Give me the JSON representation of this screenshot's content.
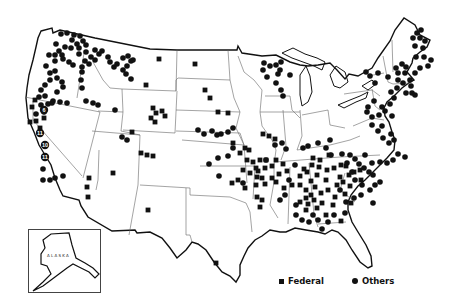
{
  "map": {
    "title": "",
    "region": "Contiguous United States with Alaska inset",
    "inset_label": "ALASKA",
    "colors": {
      "background": "#ffffff",
      "ink": "#111111",
      "state_borders": "#555555"
    }
  },
  "legend": {
    "items": [
      {
        "symbol": "square",
        "label": "Federal"
      },
      {
        "symbol": "circle",
        "label": "Others"
      }
    ]
  },
  "numbered_markers": [
    {
      "label": "6",
      "x": 44,
      "y": 110
    },
    {
      "label": "11",
      "x": 40,
      "y": 133
    },
    {
      "label": "10",
      "x": 45,
      "y": 145
    },
    {
      "label": "11",
      "x": 45,
      "y": 157
    }
  ],
  "markers": {
    "federal": [
      [
        159,
        59
      ],
      [
        195,
        64
      ],
      [
        146,
        85
      ],
      [
        205,
        90
      ],
      [
        210,
        98
      ],
      [
        218,
        112
      ],
      [
        228,
        113
      ],
      [
        153,
        108
      ],
      [
        156,
        113
      ],
      [
        162,
        111
      ],
      [
        151,
        118
      ],
      [
        165,
        116
      ],
      [
        155,
        122
      ],
      [
        132,
        132
      ],
      [
        141,
        153
      ],
      [
        147,
        155
      ],
      [
        153,
        156
      ],
      [
        89,
        178
      ],
      [
        87,
        187
      ],
      [
        88,
        197
      ],
      [
        113,
        173
      ],
      [
        148,
        210
      ],
      [
        216,
        263
      ],
      [
        233,
        143
      ],
      [
        263,
        134
      ],
      [
        269,
        136
      ],
      [
        275,
        139
      ],
      [
        245,
        148
      ],
      [
        249,
        150
      ],
      [
        240,
        153
      ],
      [
        247,
        160
      ],
      [
        253,
        162
      ],
      [
        243,
        170
      ],
      [
        250,
        173
      ],
      [
        258,
        171
      ],
      [
        262,
        178
      ],
      [
        265,
        184
      ],
      [
        256,
        185
      ],
      [
        245,
        188
      ],
      [
        238,
        180
      ],
      [
        232,
        183
      ],
      [
        257,
        197
      ],
      [
        260,
        207
      ],
      [
        272,
        178
      ],
      [
        279,
        174
      ],
      [
        272,
        166
      ],
      [
        266,
        160
      ],
      [
        276,
        160
      ],
      [
        283,
        164
      ],
      [
        287,
        171
      ],
      [
        262,
        200
      ],
      [
        260,
        160
      ],
      [
        36,
        121
      ],
      [
        30,
        122
      ],
      [
        40,
        128
      ],
      [
        35,
        100
      ],
      [
        44,
        118
      ],
      [
        32,
        107
      ],
      [
        304,
        169
      ],
      [
        312,
        165
      ],
      [
        300,
        176
      ],
      [
        307,
        172
      ],
      [
        319,
        167
      ],
      [
        327,
        170
      ],
      [
        334,
        168
      ],
      [
        346,
        166
      ],
      [
        317,
        175
      ],
      [
        311,
        181
      ],
      [
        326,
        180
      ],
      [
        300,
        185
      ],
      [
        306,
        190
      ],
      [
        315,
        187
      ],
      [
        321,
        193
      ],
      [
        306,
        198
      ],
      [
        314,
        200
      ],
      [
        322,
        203
      ],
      [
        337,
        185
      ],
      [
        343,
        182
      ],
      [
        349,
        175
      ],
      [
        354,
        172
      ],
      [
        360,
        170
      ],
      [
        345,
        194
      ],
      [
        333,
        205
      ],
      [
        317,
        208
      ],
      [
        306,
        210
      ],
      [
        326,
        215
      ],
      [
        341,
        221
      ],
      [
        257,
        177
      ],
      [
        256,
        168
      ],
      [
        265,
        168
      ],
      [
        276,
        182
      ],
      [
        284,
        188
      ],
      [
        292,
        185
      ],
      [
        311,
        195
      ],
      [
        300,
        202
      ],
      [
        335,
        197
      ],
      [
        320,
        160
      ],
      [
        313,
        158
      ],
      [
        329,
        155
      ],
      [
        341,
        165
      ],
      [
        328,
        190
      ],
      [
        351,
        203
      ],
      [
        308,
        204
      ],
      [
        340,
        177
      ],
      [
        361,
        180
      ],
      [
        350,
        186
      ]
    ],
    "others": [
      [
        61,
        34
      ],
      [
        67,
        33
      ],
      [
        74,
        35
      ],
      [
        80,
        36
      ],
      [
        72,
        40
      ],
      [
        77,
        44
      ],
      [
        83,
        41
      ],
      [
        86,
        45
      ],
      [
        79,
        48
      ],
      [
        71,
        48
      ],
      [
        65,
        47
      ],
      [
        56,
        44
      ],
      [
        59,
        51
      ],
      [
        62,
        55
      ],
      [
        55,
        55
      ],
      [
        49,
        55
      ],
      [
        55,
        61
      ],
      [
        63,
        59
      ],
      [
        69,
        62
      ],
      [
        79,
        54
      ],
      [
        86,
        52
      ],
      [
        91,
        57
      ],
      [
        85,
        61
      ],
      [
        95,
        60
      ],
      [
        73,
        65
      ],
      [
        82,
        67
      ],
      [
        89,
        64
      ],
      [
        46,
        66
      ],
      [
        50,
        73
      ],
      [
        55,
        71
      ],
      [
        50,
        80
      ],
      [
        45,
        85
      ],
      [
        57,
        78
      ],
      [
        62,
        82
      ],
      [
        63,
        87
      ],
      [
        57,
        92
      ],
      [
        41,
        90
      ],
      [
        39,
        97
      ],
      [
        45,
        96
      ],
      [
        53,
        101
      ],
      [
        48,
        104
      ],
      [
        41,
        105
      ],
      [
        36,
        114
      ],
      [
        44,
        112
      ],
      [
        52,
        103
      ],
      [
        60,
        102
      ],
      [
        67,
        103
      ],
      [
        99,
        54
      ],
      [
        102,
        51
      ],
      [
        95,
        50
      ],
      [
        108,
        57
      ],
      [
        110,
        62
      ],
      [
        114,
        67
      ],
      [
        117,
        64
      ],
      [
        123,
        58
      ],
      [
        128,
        56
      ],
      [
        131,
        61
      ],
      [
        127,
        66
      ],
      [
        123,
        70
      ],
      [
        126,
        74
      ],
      [
        131,
        79
      ],
      [
        133,
        60
      ],
      [
        82,
        72
      ],
      [
        81,
        80
      ],
      [
        82,
        88
      ],
      [
        86,
        101
      ],
      [
        93,
        103
      ],
      [
        98,
        105
      ],
      [
        115,
        110
      ],
      [
        198,
        130
      ],
      [
        204,
        134
      ],
      [
        212,
        131
      ],
      [
        217,
        135
      ],
      [
        221,
        134
      ],
      [
        228,
        132
      ],
      [
        233,
        128
      ],
      [
        122,
        137
      ],
      [
        127,
        140
      ],
      [
        63,
        176
      ],
      [
        55,
        178
      ],
      [
        50,
        180
      ],
      [
        43,
        180
      ],
      [
        43,
        169
      ],
      [
        209,
        164
      ],
      [
        218,
        158
      ],
      [
        219,
        176
      ],
      [
        243,
        183
      ],
      [
        266,
        160
      ],
      [
        275,
        145
      ],
      [
        282,
        143
      ],
      [
        286,
        149
      ],
      [
        330,
        140
      ],
      [
        326,
        148
      ],
      [
        331,
        155
      ],
      [
        342,
        154
      ],
      [
        350,
        155
      ],
      [
        355,
        159
      ],
      [
        359,
        164
      ],
      [
        364,
        168
      ],
      [
        369,
        172
      ],
      [
        355,
        180
      ],
      [
        362,
        185
      ],
      [
        370,
        190
      ],
      [
        375,
        185
      ],
      [
        380,
        182
      ],
      [
        373,
        175
      ],
      [
        347,
        163
      ],
      [
        352,
        172
      ],
      [
        340,
        190
      ],
      [
        346,
        202
      ],
      [
        354,
        198
      ],
      [
        361,
        195
      ],
      [
        373,
        203
      ],
      [
        345,
        213
      ],
      [
        334,
        215
      ],
      [
        328,
        222
      ],
      [
        322,
        229
      ],
      [
        318,
        220
      ],
      [
        313,
        215
      ],
      [
        309,
        222
      ],
      [
        302,
        220
      ],
      [
        296,
        215
      ],
      [
        296,
        205
      ],
      [
        285,
        195
      ],
      [
        280,
        200
      ],
      [
        289,
        180
      ],
      [
        295,
        165
      ],
      [
        365,
        155
      ],
      [
        372,
        163
      ],
      [
        380,
        162
      ],
      [
        387,
        163
      ],
      [
        393,
        160
      ],
      [
        398,
        154
      ],
      [
        405,
        157
      ],
      [
        389,
        143
      ],
      [
        383,
        138
      ],
      [
        378,
        131
      ],
      [
        372,
        125
      ],
      [
        367,
        112
      ],
      [
        368,
        107
      ],
      [
        374,
        101
      ],
      [
        382,
        107
      ],
      [
        390,
        104
      ],
      [
        394,
        98
      ],
      [
        391,
        92
      ],
      [
        397,
        88
      ],
      [
        406,
        93
      ],
      [
        412,
        93
      ],
      [
        415,
        95
      ],
      [
        410,
        80
      ],
      [
        411,
        86
      ],
      [
        403,
        83
      ],
      [
        398,
        80
      ],
      [
        406,
        67
      ],
      [
        402,
        64
      ],
      [
        396,
        68
      ],
      [
        388,
        77
      ],
      [
        398,
        73
      ],
      [
        405,
        73
      ],
      [
        415,
        73
      ],
      [
        420,
        68
      ],
      [
        428,
        66
      ],
      [
        431,
        60
      ],
      [
        424,
        57
      ],
      [
        416,
        57
      ],
      [
        415,
        46
      ],
      [
        423,
        48
      ],
      [
        425,
        41
      ],
      [
        420,
        38
      ],
      [
        413,
        38
      ],
      [
        417,
        33
      ],
      [
        421,
        30
      ],
      [
        375,
        83
      ],
      [
        370,
        76
      ],
      [
        378,
        73
      ],
      [
        366,
        72
      ],
      [
        379,
        115
      ],
      [
        385,
        111
      ],
      [
        392,
        116
      ],
      [
        372,
        117
      ],
      [
        382,
        126
      ],
      [
        391,
        134
      ],
      [
        394,
        140
      ],
      [
        264,
        63
      ],
      [
        270,
        66
      ],
      [
        276,
        65
      ],
      [
        281,
        62
      ],
      [
        280,
        70
      ],
      [
        278,
        74
      ],
      [
        263,
        70
      ],
      [
        276,
        83
      ],
      [
        281,
        90
      ],
      [
        283,
        96
      ],
      [
        267,
        77
      ],
      [
        290,
        75
      ],
      [
        303,
        148
      ],
      [
        308,
        146
      ],
      [
        318,
        143
      ],
      [
        233,
        148
      ],
      [
        228,
        156
      ]
    ]
  }
}
